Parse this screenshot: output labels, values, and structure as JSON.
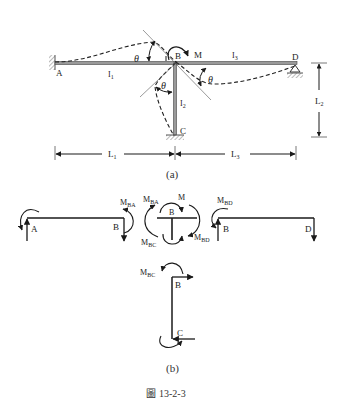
{
  "figure": {
    "caption": "圖 13-2-3",
    "caption_prefix": "圖",
    "caption_number": "13-2-3"
  },
  "part_a": {
    "label": "(a)",
    "joints": {
      "A": "A",
      "B": "B",
      "C": "C",
      "D": "D"
    },
    "members": {
      "AB": {
        "inertia_main": "I",
        "inertia_sub": "1"
      },
      "BC": {
        "inertia_main": "I",
        "inertia_sub": "2"
      },
      "BD": {
        "inertia_main": "I",
        "inertia_sub": "3"
      }
    },
    "applied_moment": "M",
    "rotation_symbol": "θ",
    "dimensions": {
      "L1": {
        "main": "L",
        "sub": "1"
      },
      "L2": {
        "main": "L",
        "sub": "2"
      },
      "L3": {
        "main": "L",
        "sub": "3"
      }
    },
    "supports": {
      "A": "fixed",
      "C": "fixed",
      "D": "pin"
    }
  },
  "part_b": {
    "label": "(b)",
    "joints": {
      "A": "A",
      "B": "B",
      "C": "C",
      "D": "D"
    },
    "moments": {
      "MBA": {
        "main": "M",
        "sub": "BA"
      },
      "MBC": {
        "main": "M",
        "sub": "BC"
      },
      "MBD": {
        "main": "M",
        "sub": "BD"
      },
      "M": "M"
    }
  },
  "colors": {
    "line": "#1a1a1a",
    "member_fill": "#9a9a9a",
    "dashed": "#222222",
    "hatch": "#888888"
  }
}
